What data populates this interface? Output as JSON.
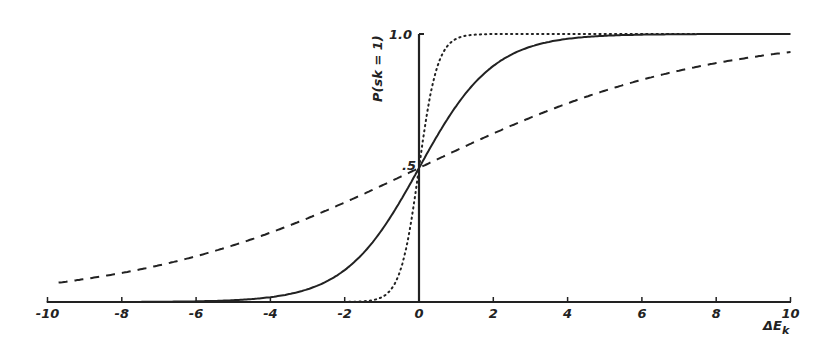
{
  "chart_data": {
    "type": "line",
    "title": "",
    "xlabel": "ΔE_k",
    "ylabel": "P(s_k = 1)",
    "xlim": [
      -10,
      10
    ],
    "ylim": [
      0,
      1.0
    ],
    "grid": false,
    "legend": null,
    "x_ticks": [
      -10,
      -8,
      -6,
      -4,
      -2,
      0,
      2,
      4,
      6,
      8,
      10
    ],
    "x_tick_labels": [
      "-10",
      "-8",
      "-6",
      "-4",
      "-2",
      "0",
      "2",
      "4",
      "6",
      "8",
      "10"
    ],
    "y_tick_labels": [
      {
        "value": 0.5,
        "label": ".5"
      },
      {
        "value": 1.0,
        "label": "1.0"
      }
    ],
    "series": [
      {
        "name": "dotted (T≈0.25)",
        "style": "dotted",
        "function": "logistic",
        "temperature": 0.25,
        "x": [
          -10,
          -2,
          -1,
          -0.5,
          0,
          0.5,
          1,
          2,
          10
        ],
        "values": [
          0.0,
          0.0003,
          0.018,
          0.12,
          0.5,
          0.88,
          0.982,
          0.9997,
          1.0
        ]
      },
      {
        "name": "solid (T≈1)",
        "style": "solid",
        "function": "logistic",
        "temperature": 1,
        "x": [
          -10,
          -6,
          -4,
          -2,
          -1,
          0,
          1,
          2,
          4,
          6,
          10
        ],
        "values": [
          0.0,
          0.002,
          0.018,
          0.12,
          0.27,
          0.5,
          0.73,
          0.88,
          0.982,
          0.998,
          1.0
        ]
      },
      {
        "name": "dashed (T≈4)",
        "style": "dashed",
        "function": "logistic",
        "temperature": 3.8,
        "x": [
          -10,
          -8,
          -6,
          -4,
          -2,
          0,
          2,
          4,
          6,
          8,
          10
        ],
        "values": [
          0.07,
          0.11,
          0.17,
          0.26,
          0.37,
          0.5,
          0.63,
          0.74,
          0.83,
          0.89,
          0.93
        ]
      }
    ]
  },
  "labels": {
    "y_axis": "P(sk = 1)",
    "x_axis": "ΔE",
    "x_axis_sub": "k",
    "y_half": ".5",
    "y_one": "1.0"
  }
}
